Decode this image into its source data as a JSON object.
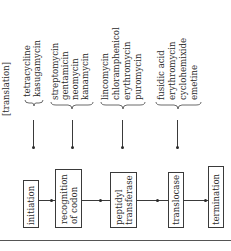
{
  "diagram": {
    "title": "[translation]",
    "groups": [
      {
        "antibiotics": [
          "tetracycline",
          "kasugamycin"
        ]
      },
      {
        "antibiotics": [
          "streptomycin",
          "gentamicin",
          "neomycin",
          "kanamycin"
        ]
      },
      {
        "antibiotics": [
          "lincomycin",
          "chloramphenicol",
          "erythromycin",
          "puromycin"
        ]
      },
      {
        "antibiotics": [
          "fusidic acid",
          "erythromycin",
          "cyclohemixide",
          "emetine"
        ]
      }
    ],
    "steps": [
      {
        "line1": "initiation",
        "line2": ""
      },
      {
        "line1": "recognition",
        "line2": "of codon"
      },
      {
        "line1": "peptidyl",
        "line2": "transferase"
      },
      {
        "line1": "translocase",
        "line2": ""
      },
      {
        "line1": "termination",
        "line2": ""
      }
    ],
    "orientation": "rotated 90° counter-clockwise"
  }
}
